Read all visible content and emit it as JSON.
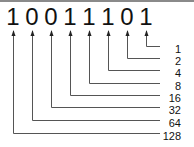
{
  "diagram": {
    "bits": [
      "1",
      "0",
      "0",
      "1",
      "1",
      "1",
      "0",
      "1"
    ],
    "place_values": [
      "1",
      "2",
      "4",
      "8",
      "16",
      "32",
      "64",
      "128"
    ],
    "colors": {
      "lines": "#555555",
      "text": "#111111",
      "top_border": "#8a8a8a"
    }
  }
}
